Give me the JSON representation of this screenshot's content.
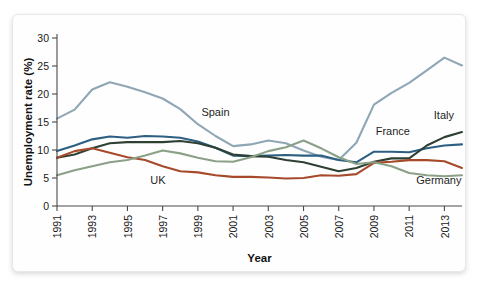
{
  "chart_data": {
    "type": "line",
    "title": "",
    "xlabel": "Year",
    "ylabel": "Unemployment rate (%)",
    "xlim": [
      1991,
      2014
    ],
    "ylim": [
      0,
      30
    ],
    "ytick_values": [
      0,
      5,
      10,
      15,
      20,
      25,
      30
    ],
    "ytick_labels": [
      "0",
      "5",
      "10",
      "15",
      "20",
      "25",
      "30"
    ],
    "xtick_values": [
      1991,
      1993,
      1995,
      1997,
      1999,
      2001,
      2003,
      2005,
      2007,
      2009,
      2011,
      2013
    ],
    "xtick_labels": [
      "1991",
      "1993",
      "1995",
      "1997",
      "1999",
      "2001",
      "2003",
      "2005",
      "2007",
      "2009",
      "2011",
      "2013"
    ],
    "grid": false,
    "legend_position": "inline-annotations",
    "x": [
      1991,
      1992,
      1993,
      1994,
      1995,
      1996,
      1997,
      1998,
      1999,
      2000,
      2001,
      2002,
      2003,
      2004,
      2005,
      2006,
      2007,
      2008,
      2009,
      2010,
      2011,
      2012,
      2013,
      2014
    ],
    "series": [
      {
        "name": "Spain",
        "color": "#8fa6b4",
        "values": [
          15.6,
          17.2,
          20.8,
          22.1,
          21.3,
          20.3,
          19.2,
          17.3,
          14.6,
          12.5,
          10.7,
          11.0,
          11.7,
          11.2,
          9.9,
          8.8,
          8.2,
          11.3,
          18.1,
          20.2,
          22.0,
          24.2,
          26.5,
          25.1
        ]
      },
      {
        "name": "France",
        "color": "#2c5f82",
        "values": [
          9.8,
          10.8,
          11.9,
          12.4,
          12.2,
          12.5,
          12.4,
          12.2,
          11.5,
          10.4,
          9.0,
          8.9,
          9.0,
          9.1,
          9.0,
          9.0,
          8.2,
          7.8,
          9.7,
          9.7,
          9.6,
          10.3,
          10.8,
          11.0
        ]
      },
      {
        "name": "Italy",
        "color": "#2d4033",
        "values": [
          8.6,
          9.2,
          10.3,
          11.2,
          11.4,
          11.4,
          11.4,
          11.6,
          11.2,
          10.4,
          9.2,
          8.9,
          8.8,
          8.2,
          7.8,
          7.0,
          6.2,
          6.8,
          7.9,
          8.5,
          8.5,
          10.8,
          12.3,
          13.2
        ]
      },
      {
        "name": "UK",
        "color": "#a74a2c",
        "values": [
          8.6,
          9.8,
          10.3,
          9.5,
          8.7,
          8.2,
          7.1,
          6.2,
          6.0,
          5.5,
          5.2,
          5.2,
          5.1,
          4.9,
          5.0,
          5.5,
          5.4,
          5.7,
          7.7,
          7.9,
          8.2,
          8.2,
          8.0,
          6.8
        ]
      },
      {
        "name": "Germany",
        "color": "#8ba187",
        "values": [
          5.5,
          6.4,
          7.1,
          7.8,
          8.2,
          9.0,
          9.9,
          9.4,
          8.6,
          8.0,
          7.9,
          8.7,
          9.8,
          10.5,
          11.7,
          10.3,
          8.7,
          7.5,
          7.8,
          7.1,
          5.9,
          5.5,
          5.3,
          5.5
        ]
      }
    ],
    "annotations": [
      {
        "text": "Spain",
        "x": 1999.2,
        "y": 16.0
      },
      {
        "text": "UK",
        "x": 1996.3,
        "y": 3.9
      },
      {
        "text": "France",
        "x": 2009.1,
        "y": 12.6
      },
      {
        "text": "Italy",
        "x": 2012.4,
        "y": 15.6
      },
      {
        "text": "Germany",
        "x": 2011.4,
        "y": 3.9
      }
    ]
  }
}
